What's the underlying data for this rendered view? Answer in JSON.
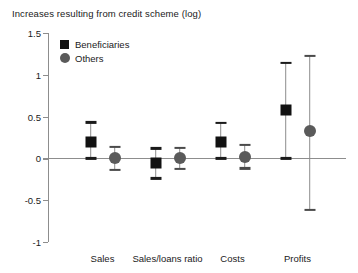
{
  "chart_data": {
    "type": "scatter",
    "title": "Increases resulting from credit scheme (log)",
    "xlabel": "",
    "ylabel": "",
    "ylim": [
      -1,
      1.5
    ],
    "yticks": [
      1.5,
      1,
      0.5,
      0,
      -0.5,
      -1
    ],
    "ytick_labels": [
      "1.5",
      "1",
      "0.5",
      "0",
      "-0.5",
      "-1"
    ],
    "grid": false,
    "zero_reference_line": true,
    "legend_position": "top-left",
    "categories": [
      "Sales",
      "Sales/loans ratio",
      "Costs",
      "Profits"
    ],
    "series": [
      {
        "name": "Beneficiaries",
        "marker": "square",
        "color": "#111111",
        "values": [
          0.2,
          -0.06,
          0.2,
          0.58
        ],
        "error_low": [
          0.0,
          -0.24,
          0.0,
          0.0
        ],
        "error_high": [
          0.43,
          0.12,
          0.42,
          1.14
        ]
      },
      {
        "name": "Others",
        "marker": "circle",
        "color": "#5a5a5a",
        "values": [
          0.01,
          0.01,
          0.02,
          0.33
        ],
        "error_low": [
          -0.14,
          -0.13,
          -0.12,
          -0.62
        ],
        "error_high": [
          0.14,
          0.13,
          0.16,
          1.23
        ]
      }
    ]
  },
  "legend": {
    "items": [
      {
        "label": "Beneficiaries",
        "marker": "square"
      },
      {
        "label": "Others",
        "marker": "circle"
      }
    ]
  }
}
